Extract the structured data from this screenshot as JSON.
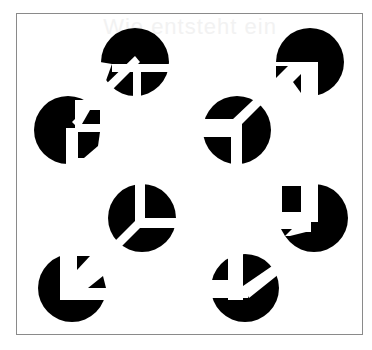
{
  "figure": {
    "ghost_text": "Wie entsteht ein",
    "colors": {
      "disk": "#000000",
      "background": "#ffffff",
      "frame": "#8a8a8a"
    },
    "disks": [
      {
        "id": "top-left-back",
        "cx": 135,
        "cy": 62,
        "r": 34
      },
      {
        "id": "top-right-back",
        "cx": 310,
        "cy": 62,
        "r": 34
      },
      {
        "id": "top-left-front",
        "cx": 68,
        "cy": 130,
        "r": 34
      },
      {
        "id": "top-right-front",
        "cx": 237,
        "cy": 130,
        "r": 34
      },
      {
        "id": "bottom-left-back",
        "cx": 142,
        "cy": 218,
        "r": 34
      },
      {
        "id": "bottom-right-back",
        "cx": 314,
        "cy": 218,
        "r": 34
      },
      {
        "id": "bottom-left-front",
        "cx": 72,
        "cy": 288,
        "r": 34
      },
      {
        "id": "bottom-right-front",
        "cx": 245,
        "cy": 288,
        "r": 34
      }
    ]
  }
}
